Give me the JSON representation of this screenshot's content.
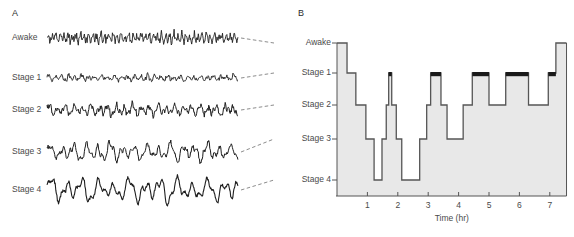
{
  "figure": {
    "panel_a": {
      "letter": "A",
      "traces": [
        {
          "label": "Awake",
          "y": 38,
          "amplitude": 5.5,
          "frequency": 1.55,
          "noise": 2.6,
          "thickness": 0.9
        },
        {
          "label": "Stage 1",
          "y": 78,
          "amplitude": 3.2,
          "frequency": 0.95,
          "noise": 1.5,
          "thickness": 0.9
        },
        {
          "label": "Stage 2",
          "y": 110,
          "amplitude": 6.0,
          "frequency": 0.75,
          "noise": 2.2,
          "thickness": 1.0
        },
        {
          "label": "Stage 3",
          "y": 152,
          "amplitude": 9.5,
          "frequency": 0.52,
          "noise": 2.0,
          "thickness": 1.0
        },
        {
          "label": "Stage 4",
          "y": 190,
          "amplitude": 13.0,
          "frequency": 0.4,
          "noise": 1.6,
          "thickness": 1.1
        }
      ],
      "trace_x_start": 47,
      "trace_x_end": 238
    },
    "panel_b": {
      "letter": "B",
      "stage_labels": [
        "Awake",
        "Stage 1",
        "Stage 2",
        "Stage 3",
        "Stage 4"
      ],
      "xaxis_title": "Time (hr)",
      "xtick_labels": [
        "1",
        "2",
        "3",
        "4",
        "5",
        "6",
        "7"
      ],
      "colors": {
        "fill": "#e8e8e8",
        "line": "#555555",
        "rem": "#1a1a1a",
        "axis": "#555555"
      }
    },
    "chart_data": {
      "type": "line",
      "title": "Sleep stage hypnogram",
      "xlabel": "Time (hr)",
      "ylabel": "Sleep stage",
      "xlim": [
        0,
        7.7
      ],
      "xticks": [
        1,
        2,
        3,
        4,
        5,
        6,
        7
      ],
      "categories": [
        "Awake",
        "Stage 1",
        "Stage 2",
        "Stage 3",
        "Stage 4"
      ],
      "stage_levels": {
        "Awake": 0,
        "Stage 1": 1,
        "Stage 2": 2,
        "Stage 3": 3,
        "Stage 4": 4
      },
      "grid": false,
      "legend": null,
      "segments": [
        {
          "start": 0.0,
          "end": 0.33,
          "stage": "Awake",
          "level": 0,
          "rem": false
        },
        {
          "start": 0.33,
          "end": 0.62,
          "stage": "Stage 1",
          "level": 1,
          "rem": false
        },
        {
          "start": 0.62,
          "end": 0.95,
          "stage": "Stage 2",
          "level": 2,
          "rem": false
        },
        {
          "start": 0.95,
          "end": 1.22,
          "stage": "Stage 3",
          "level": 3,
          "rem": false
        },
        {
          "start": 1.22,
          "end": 1.48,
          "stage": "Stage 4",
          "level": 4,
          "rem": false
        },
        {
          "start": 1.48,
          "end": 1.62,
          "stage": "Stage 3",
          "level": 3,
          "rem": false
        },
        {
          "start": 1.62,
          "end": 1.7,
          "stage": "Stage 2",
          "level": 2,
          "rem": false
        },
        {
          "start": 1.7,
          "end": 1.8,
          "stage": "Stage 1",
          "level": 1,
          "rem": true
        },
        {
          "start": 1.8,
          "end": 1.95,
          "stage": "Stage 2",
          "level": 2,
          "rem": false
        },
        {
          "start": 1.95,
          "end": 2.13,
          "stage": "Stage 3",
          "level": 3,
          "rem": false
        },
        {
          "start": 2.13,
          "end": 2.72,
          "stage": "Stage 4",
          "level": 4,
          "rem": false
        },
        {
          "start": 2.72,
          "end": 2.95,
          "stage": "Stage 3",
          "level": 3,
          "rem": false
        },
        {
          "start": 2.95,
          "end": 3.08,
          "stage": "Stage 2",
          "level": 2,
          "rem": false
        },
        {
          "start": 3.08,
          "end": 3.42,
          "stage": "Stage 1",
          "level": 1,
          "rem": true
        },
        {
          "start": 3.42,
          "end": 3.62,
          "stage": "Stage 2",
          "level": 2,
          "rem": false
        },
        {
          "start": 3.62,
          "end": 4.15,
          "stage": "Stage 3",
          "level": 3,
          "rem": false
        },
        {
          "start": 4.15,
          "end": 4.45,
          "stage": "Stage 2",
          "level": 2,
          "rem": false
        },
        {
          "start": 4.45,
          "end": 5.0,
          "stage": "Stage 1",
          "level": 1,
          "rem": true
        },
        {
          "start": 5.0,
          "end": 5.55,
          "stage": "Stage 2",
          "level": 2,
          "rem": false
        },
        {
          "start": 5.55,
          "end": 6.3,
          "stage": "Stage 1",
          "level": 1,
          "rem": true
        },
        {
          "start": 6.3,
          "end": 6.95,
          "stage": "Stage 2",
          "level": 2,
          "rem": false
        },
        {
          "start": 6.95,
          "end": 7.2,
          "stage": "Stage 1",
          "level": 1,
          "rem": true
        },
        {
          "start": 7.2,
          "end": 7.55,
          "stage": "Awake",
          "level": 0,
          "rem": false
        }
      ]
    }
  }
}
